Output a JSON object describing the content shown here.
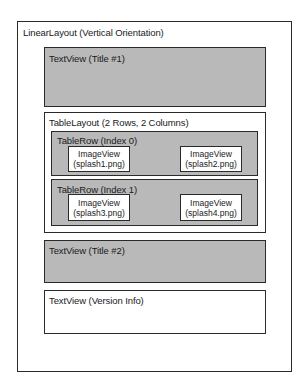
{
  "diagram": {
    "linear_layout": {
      "label": "LinearLayout (Vertical Orientation)"
    },
    "title1": {
      "label": "TextView (Title #1)"
    },
    "table_layout": {
      "label": "TableLayout (2 Rows, 2 Columns)",
      "rows": [
        {
          "label": "TableRow (Index 0)",
          "cells": [
            {
              "type": "ImageView",
              "file": "(splash1.png)"
            },
            {
              "type": "ImageView",
              "file": "(splash2.png)"
            }
          ]
        },
        {
          "label": "TableRow (Index 1)",
          "cells": [
            {
              "type": "ImageView",
              "file": "(splash3.png)"
            },
            {
              "type": "ImageView",
              "file": "(splash4.png)"
            }
          ]
        }
      ]
    },
    "title2": {
      "label": "TextView (Title #2)"
    },
    "version_info": {
      "label": "TextView (Version Info)"
    },
    "colors": {
      "gray_fill": "#b9b9b9",
      "border": "#2a2a2a",
      "background": "#ffffff"
    }
  }
}
